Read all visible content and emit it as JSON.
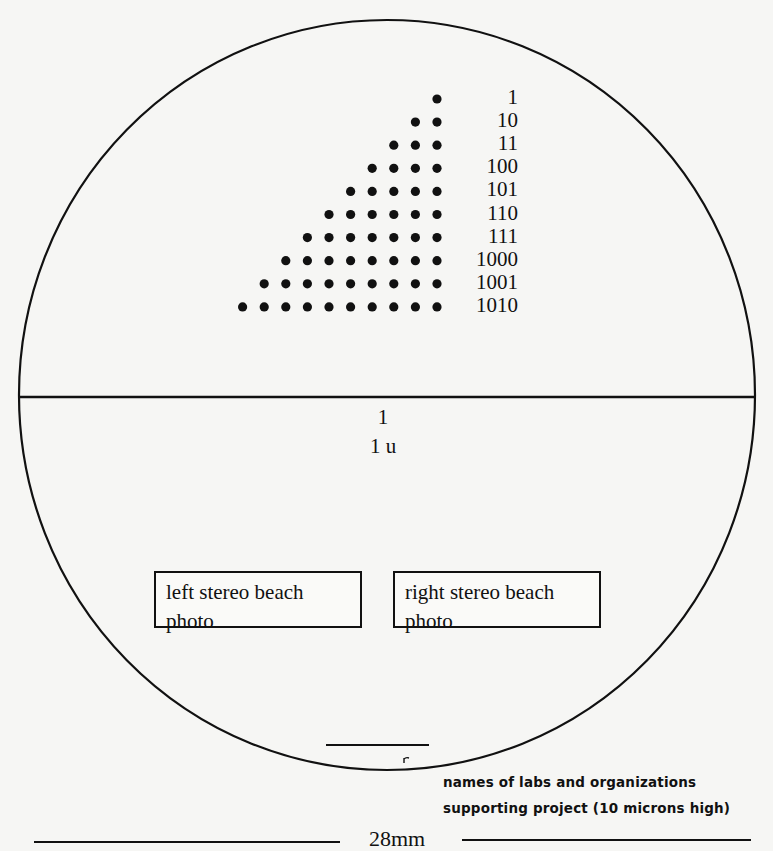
{
  "diagram": {
    "colors": {
      "background": "#f6f6f4",
      "ink": "#111111"
    },
    "dot_triangle": {
      "rows": [
        {
          "label": "1",
          "dots": 1
        },
        {
          "label": "10",
          "dots": 2
        },
        {
          "label": "11",
          "dots": 3
        },
        {
          "label": "100",
          "dots": 4
        },
        {
          "label": "101",
          "dots": 5
        },
        {
          "label": "110",
          "dots": 6
        },
        {
          "label": "111",
          "dots": 7
        },
        {
          "label": "1000",
          "dots": 8
        },
        {
          "label": "1001",
          "dots": 9
        },
        {
          "label": "1010",
          "dots": 10
        }
      ]
    },
    "scale_marker": {
      "line1": "1",
      "line2": "1 u"
    },
    "photos": {
      "left": "left stereo beach photo",
      "right": "right stereo beach photo"
    },
    "caption": {
      "line1": "names of labs and organizations",
      "line2": "supporting project  (10 microns high)"
    },
    "bottom_scale": {
      "label": "28mm"
    }
  }
}
